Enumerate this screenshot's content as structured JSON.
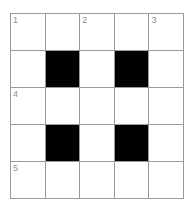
{
  "puzzle": {
    "title": "Crossword Grid",
    "rows": 5,
    "columns": 5,
    "colors": {
      "background": "#ffffff",
      "grid_line": "#9a9a9a",
      "block": "#000000",
      "number": "#8d8d8d"
    },
    "cells": [
      [
        {
          "type": "open",
          "number": "1",
          "letter": ""
        },
        {
          "type": "open",
          "number": "",
          "letter": ""
        },
        {
          "type": "open",
          "number": "2",
          "letter": ""
        },
        {
          "type": "open",
          "number": "",
          "letter": ""
        },
        {
          "type": "open",
          "number": "3",
          "letter": ""
        }
      ],
      [
        {
          "type": "open",
          "number": "",
          "letter": ""
        },
        {
          "type": "block",
          "number": "",
          "letter": ""
        },
        {
          "type": "open",
          "number": "",
          "letter": ""
        },
        {
          "type": "block",
          "number": "",
          "letter": ""
        },
        {
          "type": "open",
          "number": "",
          "letter": ""
        }
      ],
      [
        {
          "type": "open",
          "number": "4",
          "letter": ""
        },
        {
          "type": "open",
          "number": "",
          "letter": ""
        },
        {
          "type": "open",
          "number": "",
          "letter": ""
        },
        {
          "type": "open",
          "number": "",
          "letter": ""
        },
        {
          "type": "open",
          "number": "",
          "letter": ""
        }
      ],
      [
        {
          "type": "open",
          "number": "",
          "letter": ""
        },
        {
          "type": "block",
          "number": "",
          "letter": ""
        },
        {
          "type": "open",
          "number": "",
          "letter": ""
        },
        {
          "type": "block",
          "number": "",
          "letter": ""
        },
        {
          "type": "open",
          "number": "",
          "letter": ""
        }
      ],
      [
        {
          "type": "open",
          "number": "5",
          "letter": ""
        },
        {
          "type": "open",
          "number": "",
          "letter": ""
        },
        {
          "type": "open",
          "number": "",
          "letter": ""
        },
        {
          "type": "open",
          "number": "",
          "letter": ""
        },
        {
          "type": "open",
          "number": "",
          "letter": ""
        }
      ]
    ]
  }
}
